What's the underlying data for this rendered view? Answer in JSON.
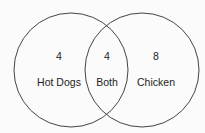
{
  "diagram": {
    "type": "venn",
    "sets": [
      {
        "label": "Hot Dogs",
        "count": "4"
      },
      {
        "label": "Chicken",
        "count": "8"
      }
    ],
    "intersection": {
      "label": "Both",
      "count": "4"
    },
    "stroke_color": "#444444",
    "background": "#fbfbfb"
  }
}
